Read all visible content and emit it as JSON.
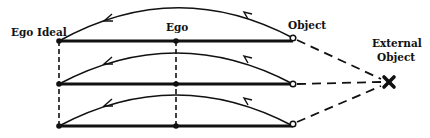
{
  "diagram": {
    "labels": {
      "ego_ideal": "Ego Ideal",
      "ego": "Ego",
      "object": "Object",
      "external_object_line1": "External",
      "external_object_line2": "Object"
    },
    "rows": [
      {
        "y": 41,
        "arc_peak_y": 8
      },
      {
        "y": 84,
        "arc_peak_y": 52
      },
      {
        "y": 126,
        "arc_peak_y": 94
      }
    ],
    "columns": {
      "ego_ideal_x": 59,
      "ego_x": 176,
      "object_x": 293
    },
    "external_object": {
      "x": 389,
      "y": 82,
      "marker": "✖"
    },
    "colors": {
      "ink": "#111111",
      "background": "#ffffff"
    }
  }
}
